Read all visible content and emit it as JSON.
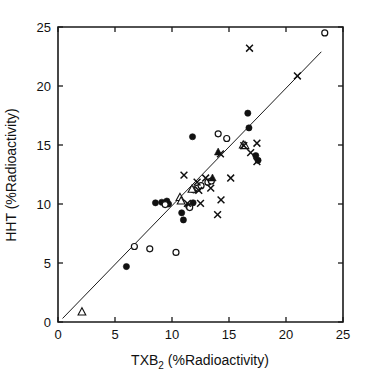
{
  "chart_data": {
    "type": "scatter",
    "title": "",
    "subtitle": "",
    "xlabel": "TXB2 (%Radioactivity)",
    "xlabel_main": "TXB",
    "xlabel_sub": "2",
    "xlabel_rest": " (%Radioactivity)",
    "ylabel": "HHT (%Radioactivity)",
    "xlim": [
      0,
      25
    ],
    "ylim": [
      0,
      25
    ],
    "xticks": [
      0,
      5,
      10,
      15,
      20,
      25
    ],
    "yticks": [
      0,
      5,
      10,
      15,
      20,
      25
    ],
    "xticklabels": [
      "0",
      "5",
      "10",
      "15",
      "20",
      "25"
    ],
    "yticklabels": [
      "0",
      "5",
      "10",
      "15",
      "20",
      "25"
    ],
    "grid": false,
    "legend": "none",
    "legend_position": "none",
    "reference_line": {
      "name": "identity-fit-line",
      "type": "line",
      "x": [
        0.4,
        23.1
      ],
      "y": [
        0.3,
        22.9
      ],
      "color": "#111111"
    },
    "series": [
      {
        "name": "filled-circle",
        "marker": "filled-circle",
        "color": "#111111",
        "points": [
          [
            6.0,
            4.7
          ],
          [
            8.55,
            10.1
          ],
          [
            9.1,
            10.15
          ],
          [
            9.55,
            10.25
          ],
          [
            9.7,
            10.0
          ],
          [
            10.85,
            9.25
          ],
          [
            11.0,
            8.65
          ],
          [
            11.45,
            9.8
          ],
          [
            11.85,
            10.1
          ],
          [
            11.8,
            15.7
          ],
          [
            16.65,
            17.7
          ],
          [
            16.75,
            16.45
          ],
          [
            17.35,
            14.1
          ],
          [
            17.55,
            13.7
          ]
        ]
      },
      {
        "name": "open-circle",
        "marker": "open-circle",
        "color": "#111111",
        "points": [
          [
            6.7,
            6.4
          ],
          [
            8.05,
            6.2
          ],
          [
            9.4,
            9.95
          ],
          [
            10.35,
            5.9
          ],
          [
            11.55,
            9.7
          ],
          [
            11.9,
            11.2
          ],
          [
            12.25,
            11.35
          ],
          [
            12.55,
            11.55
          ],
          [
            13.15,
            11.85
          ],
          [
            13.45,
            11.95
          ],
          [
            14.05,
            15.95
          ],
          [
            14.8,
            15.55
          ],
          [
            23.4,
            24.5
          ]
        ]
      },
      {
        "name": "open-triangle",
        "marker": "open-triangle",
        "color": "#111111",
        "points": [
          [
            2.1,
            0.85
          ],
          [
            10.7,
            10.55
          ],
          [
            10.8,
            10.25
          ],
          [
            11.75,
            11.25
          ],
          [
            16.25,
            15.0
          ],
          [
            16.4,
            14.95
          ]
        ]
      },
      {
        "name": "filled-triangle",
        "marker": "filled-triangle",
        "color": "#111111",
        "points": [
          [
            13.55,
            12.2
          ],
          [
            14.05,
            14.4
          ]
        ]
      },
      {
        "name": "cross",
        "marker": "cross",
        "color": "#111111",
        "points": [
          [
            11.05,
            12.45
          ],
          [
            11.35,
            10.05
          ],
          [
            12.2,
            11.85
          ],
          [
            12.35,
            11.15
          ],
          [
            12.5,
            10.05
          ],
          [
            12.95,
            12.2
          ],
          [
            13.4,
            11.35
          ],
          [
            14.0,
            9.1
          ],
          [
            14.25,
            14.25
          ],
          [
            14.3,
            10.35
          ],
          [
            15.15,
            12.2
          ],
          [
            16.3,
            14.95
          ],
          [
            16.8,
            23.2
          ],
          [
            16.9,
            14.35
          ],
          [
            17.45,
            15.15
          ],
          [
            17.45,
            13.6
          ],
          [
            21.0,
            20.85
          ]
        ]
      }
    ]
  },
  "axes": {
    "x_pixel_0": 58,
    "x_pixel_25": 343,
    "y_pixel_0": 322,
    "y_pixel_25": 27
  }
}
